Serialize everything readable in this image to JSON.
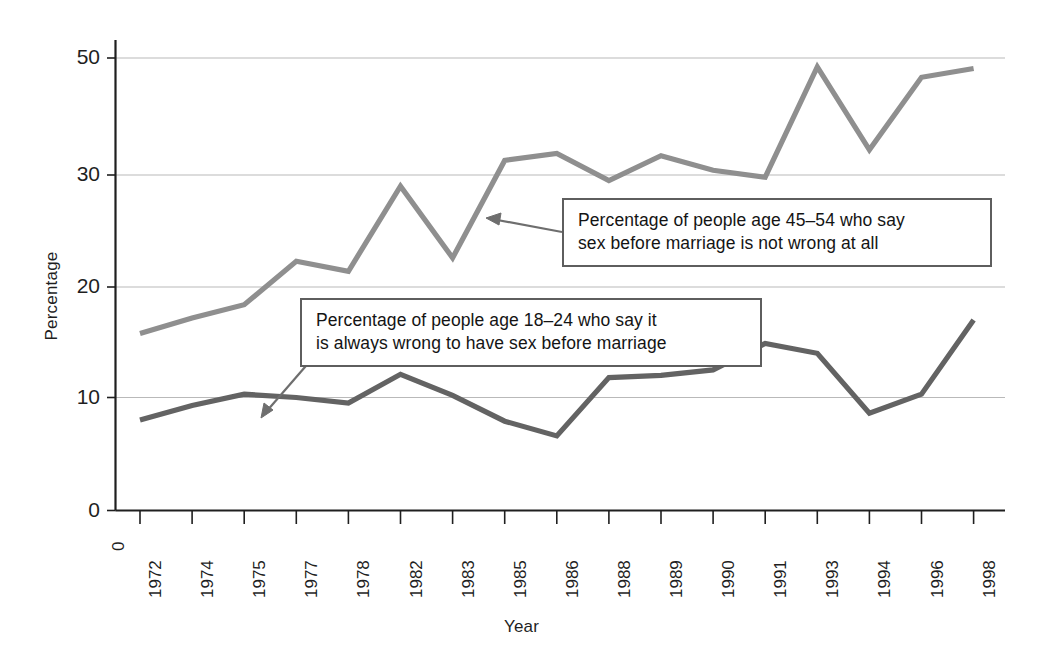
{
  "chart_data": {
    "type": "line",
    "title": "",
    "xlabel": "Year",
    "ylabel": "Percentage",
    "grid": "horizontal",
    "legend_position": "annotation-callouts",
    "x_is_categorical": true,
    "categories": [
      "1972",
      "1974",
      "1975",
      "1977",
      "1978",
      "1982",
      "1983",
      "1985",
      "1986",
      "1988",
      "1989",
      "1990",
      "1991",
      "1993",
      "1994",
      "1996",
      "1998"
    ],
    "xtick_labels": [
      "1972",
      "1974",
      "1975",
      "1977",
      "1978",
      "1982",
      "1983",
      "1985",
      "1986",
      "1988",
      "1989",
      "1990",
      "1991",
      "1993",
      "1994",
      "1996",
      "1998"
    ],
    "x_origin_label": "0",
    "ytick_labels": [
      "0",
      "10",
      "20",
      "30",
      "50"
    ],
    "ytick_values": [
      0,
      10,
      20,
      30,
      50
    ],
    "ylim": [
      0,
      50
    ],
    "y_axis_note": "tick labels 0,10,20,30,50 are drawn at equal pixel spacing (axis as printed)",
    "series": [
      {
        "name": "Percentage of people age 45–54 who say sex before marriage is not wrong at all",
        "short_name": "age 45-54 not wrong at all",
        "color": "#8f8f8f",
        "values": [
          15.8,
          17.2,
          18.4,
          22.3,
          21.4,
          29.0,
          22.6,
          32.5,
          33.7,
          29.5,
          33.3,
          30.8,
          29.8,
          48.5,
          34.3,
          46.7,
          48.2
        ]
      },
      {
        "name": "Percentage of people age 18–24 who say it is always wrong to have sex before marriage",
        "short_name": "age 18-24 always wrong",
        "color": "#636363",
        "values": [
          8.0,
          9.3,
          10.3,
          10.0,
          9.5,
          12.1,
          10.2,
          7.9,
          6.6,
          11.8,
          12.0,
          12.5,
          14.9,
          14.0,
          8.6,
          10.3,
          17.0
        ]
      }
    ]
  },
  "annotations": [
    {
      "id": "callout-45-54",
      "lines": [
        "Percentage of people age 45–54 who say",
        "sex before marriage is not wrong at all"
      ],
      "points_to_series": "age 45-54 not wrong at all"
    },
    {
      "id": "callout-18-24",
      "lines": [
        "Percentage of people age 18–24 who say it",
        "is always wrong to have sex before marriage"
      ],
      "points_to_series": "age 18-24 always wrong"
    }
  ],
  "colors": {
    "series_upper": "#8f8f8f",
    "series_lower": "#636363",
    "axis": "#1f1f1f",
    "gridline": "#b9b9b9",
    "callout_border": "#5e5e5e",
    "background": "#ffffff",
    "text": "#141414"
  }
}
